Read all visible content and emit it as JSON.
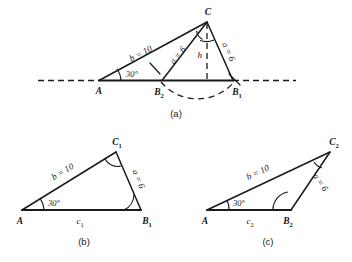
{
  "figure": {
    "background_color": "#ffffff",
    "ink_color": "#1a1a1a"
  },
  "panels": [
    {
      "id": "a",
      "caption": "(a)",
      "vertices": [
        {
          "name": "A",
          "label": "A",
          "subscript": ""
        },
        {
          "name": "B2",
          "label": "B",
          "subscript": "2"
        },
        {
          "name": "B1",
          "label": "B",
          "subscript": "1"
        },
        {
          "name": "C",
          "label": "C",
          "subscript": ""
        }
      ],
      "side_labels": [
        {
          "name": "side-b",
          "text": "b = 10"
        },
        {
          "name": "side-a-left",
          "text": "a = 6"
        },
        {
          "name": "side-a-right",
          "text": "a = 6"
        },
        {
          "name": "altitude-h",
          "text": "h"
        }
      ],
      "angle_labels": [
        {
          "name": "angle-A",
          "text": "30°"
        }
      ]
    },
    {
      "id": "b",
      "caption": "(b)",
      "vertices": [
        {
          "name": "A",
          "label": "A",
          "subscript": ""
        },
        {
          "name": "B1",
          "label": "B",
          "subscript": "1"
        },
        {
          "name": "C1",
          "label": "C",
          "subscript": "1"
        }
      ],
      "side_labels": [
        {
          "name": "side-b",
          "text": "b = 10"
        },
        {
          "name": "side-a",
          "text": "a = 6"
        },
        {
          "name": "side-c",
          "text": "c",
          "subscript": "1"
        }
      ],
      "angle_labels": [
        {
          "name": "angle-A",
          "text": "30°"
        }
      ]
    },
    {
      "id": "c",
      "caption": "(c)",
      "vertices": [
        {
          "name": "A",
          "label": "A",
          "subscript": ""
        },
        {
          "name": "B2",
          "label": "B",
          "subscript": "2"
        },
        {
          "name": "C2",
          "label": "C",
          "subscript": "2"
        }
      ],
      "side_labels": [
        {
          "name": "side-b",
          "text": "b = 10"
        },
        {
          "name": "side-a",
          "text": "a = 6"
        },
        {
          "name": "side-c",
          "text": "c",
          "subscript": "2"
        }
      ],
      "angle_labels": [
        {
          "name": "angle-A",
          "text": "30°"
        }
      ]
    }
  ]
}
